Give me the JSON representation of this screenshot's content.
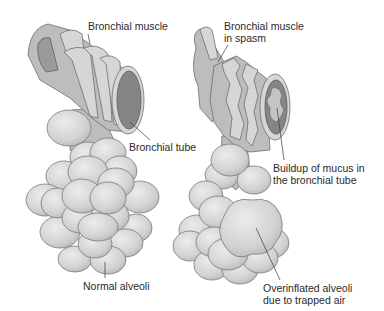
{
  "figure": {
    "left_panel": {
      "labels": {
        "bronchial_muscle": "Bronchial muscle",
        "bronchial_tube": "Bronchial tube",
        "normal_alveoli": "Normal alveoli"
      }
    },
    "right_panel": {
      "labels": {
        "muscle_spasm_line1": "Bronchial muscle",
        "muscle_spasm_line2": "in spasm",
        "mucus_line1": "Buildup of mucus in",
        "mucus_line2": "the bronchial tube",
        "overinflated_line1": "Overinflated alveoli",
        "overinflated_line2": "due to trapped air"
      }
    },
    "colors": {
      "background": "#ffffff",
      "tissue": "#bdbdbd",
      "lumen": "#858585",
      "alveoli": "#d9d9d9",
      "text": "#2a2a2a"
    }
  }
}
